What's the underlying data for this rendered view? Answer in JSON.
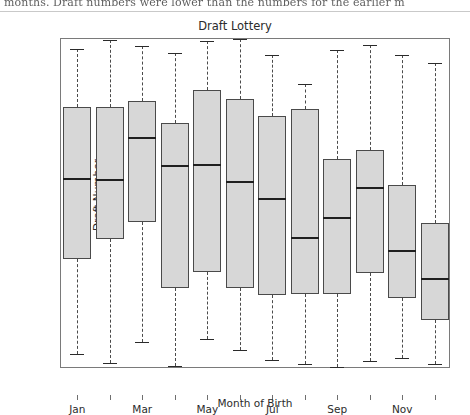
{
  "page": {
    "scanned_text_fragment": "months. Draft numbers were lower than the numbers for the earlier m"
  },
  "chart_data": {
    "type": "box",
    "title": "Draft Lottery",
    "xlabel": "Month of Birth",
    "ylabel": "Draft Number",
    "ylim": [
      0,
      366
    ],
    "yticks": [
      0,
      100,
      200,
      300
    ],
    "ytick_labels": [
      "0",
      "100",
      "200",
      "300"
    ],
    "grid": false,
    "legend": null,
    "categories": [
      "Jan",
      "Feb",
      "Mar",
      "Apr",
      "May",
      "Jun",
      "Jul",
      "Aug",
      "Sep",
      "Oct",
      "Nov",
      "Dec"
    ],
    "xtick_labels_shown": [
      "Jan",
      "Mar",
      "May",
      "Jul",
      "Sep",
      "Nov"
    ],
    "boxes": [
      {
        "month": "Jan",
        "whisker_low": 17,
        "q1": 122,
        "median": 211,
        "q3": 291,
        "whisker_high": 355
      },
      {
        "month": "Feb",
        "whisker_low": 7,
        "q1": 144,
        "median": 210,
        "q3": 291,
        "whisker_high": 365
      },
      {
        "month": "Mar",
        "whisker_low": 30,
        "q1": 163,
        "median": 256,
        "q3": 297,
        "whisker_high": 358
      },
      {
        "month": "Apr",
        "whisker_low": 3,
        "q1": 90,
        "median": 225,
        "q3": 273,
        "whisker_high": 350
      },
      {
        "month": "May",
        "whisker_low": 33,
        "q1": 108,
        "median": 226,
        "q3": 309,
        "whisker_high": 364
      },
      {
        "month": "Jun",
        "whisker_low": 21,
        "q1": 90,
        "median": 207,
        "q3": 300,
        "whisker_high": 366
      },
      {
        "month": "Jul",
        "whisker_low": 10,
        "q1": 82,
        "median": 188,
        "q3": 281,
        "whisker_high": 348
      },
      {
        "month": "Aug",
        "whisker_low": 5,
        "q1": 83,
        "median": 145,
        "q3": 288,
        "whisker_high": 316
      },
      {
        "month": "Sep",
        "whisker_low": 2,
        "q1": 83,
        "median": 168,
        "q3": 233,
        "whisker_high": 354
      },
      {
        "month": "Oct",
        "whisker_low": 9,
        "q1": 107,
        "median": 201,
        "q3": 243,
        "whisker_high": 359
      },
      {
        "month": "Nov",
        "whisker_low": 12,
        "q1": 79,
        "median": 131,
        "q3": 204,
        "whisker_high": 348
      },
      {
        "month": "Dec",
        "whisker_low": 6,
        "q1": 54,
        "median": 100,
        "q3": 162,
        "whisker_high": 339
      }
    ]
  }
}
